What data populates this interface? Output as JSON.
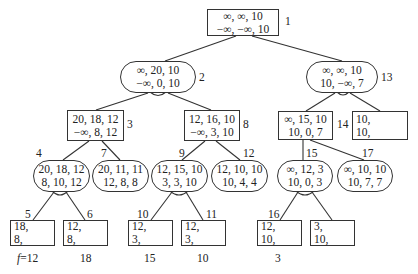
{
  "diagram": {
    "type": "and-or search tree",
    "nodes": [
      {
        "id": "1",
        "shape": "rect",
        "line1": "∞, ∞, 10",
        "line2": "−∞, −∞, 10"
      },
      {
        "id": "2",
        "shape": "pill",
        "line1": "∞, 20, 10",
        "line2": "−∞, 0, 10"
      },
      {
        "id": "13",
        "shape": "pill",
        "line1": "∞, ∞, 10",
        "line2": "10, −∞, 7"
      },
      {
        "id": "3",
        "shape": "rect",
        "line1": "20, 18, 12",
        "line2": "−∞, 8, 12"
      },
      {
        "id": "8",
        "shape": "rect",
        "line1": "12, 16, 10",
        "line2": "−∞, 3, 10"
      },
      {
        "id": "14",
        "shape": "rect",
        "line1": "∞, 15, 10",
        "line2": "10, 0, 7"
      },
      {
        "id": "13b",
        "shape": "rect",
        "line1": "10,",
        "line2": "10,"
      },
      {
        "id": "4",
        "shape": "pill",
        "line1": "20, 18, 12",
        "line2": "8, 10, 12"
      },
      {
        "id": "7",
        "shape": "pill",
        "line1": "20, 11, 11",
        "line2": "12, 8, 8"
      },
      {
        "id": "9",
        "shape": "pill",
        "line1": "12, 15, 10",
        "line2": "3, 3, 10"
      },
      {
        "id": "12",
        "shape": "pill",
        "line1": "12, 10, 10",
        "line2": "10, 4, 4"
      },
      {
        "id": "15",
        "shape": "pill",
        "line1": "∞, 12, 3",
        "line2": "10, 0, 3"
      },
      {
        "id": "17",
        "shape": "pill",
        "line1": "∞, 10, 10",
        "line2": "10, 7, 7"
      },
      {
        "id": "5",
        "shape": "rect",
        "line1": "18,",
        "line2": "8,",
        "f": "12"
      },
      {
        "id": "6",
        "shape": "rect",
        "line1": "12,",
        "line2": "8,",
        "f": "18"
      },
      {
        "id": "10",
        "shape": "rect",
        "line1": "12,",
        "line2": "3,",
        "f": "15"
      },
      {
        "id": "11",
        "shape": "rect",
        "line1": "12,",
        "line2": "3,",
        "f": "10"
      },
      {
        "id": "16",
        "shape": "rect",
        "line1": "12,",
        "line2": "10,",
        "f": "3"
      },
      {
        "id": "16b",
        "shape": "rect",
        "line1": "3,",
        "line2": "10,"
      }
    ],
    "labels": {
      "n1": "1",
      "n2": "2",
      "n13": "13",
      "n3": "3",
      "n8": "8",
      "n14": "14",
      "n4": "4",
      "n7": "7",
      "n9": "9",
      "n12": "12",
      "n15": "15",
      "n17": "17",
      "n5": "5",
      "n6": "6",
      "n10": "10",
      "n11": "11",
      "n16": "16"
    },
    "f_values": {
      "f_prefix": "f",
      "f_eq": "=12",
      "n6": "18",
      "n10": "15",
      "n11": "10",
      "n16": "3"
    }
  }
}
